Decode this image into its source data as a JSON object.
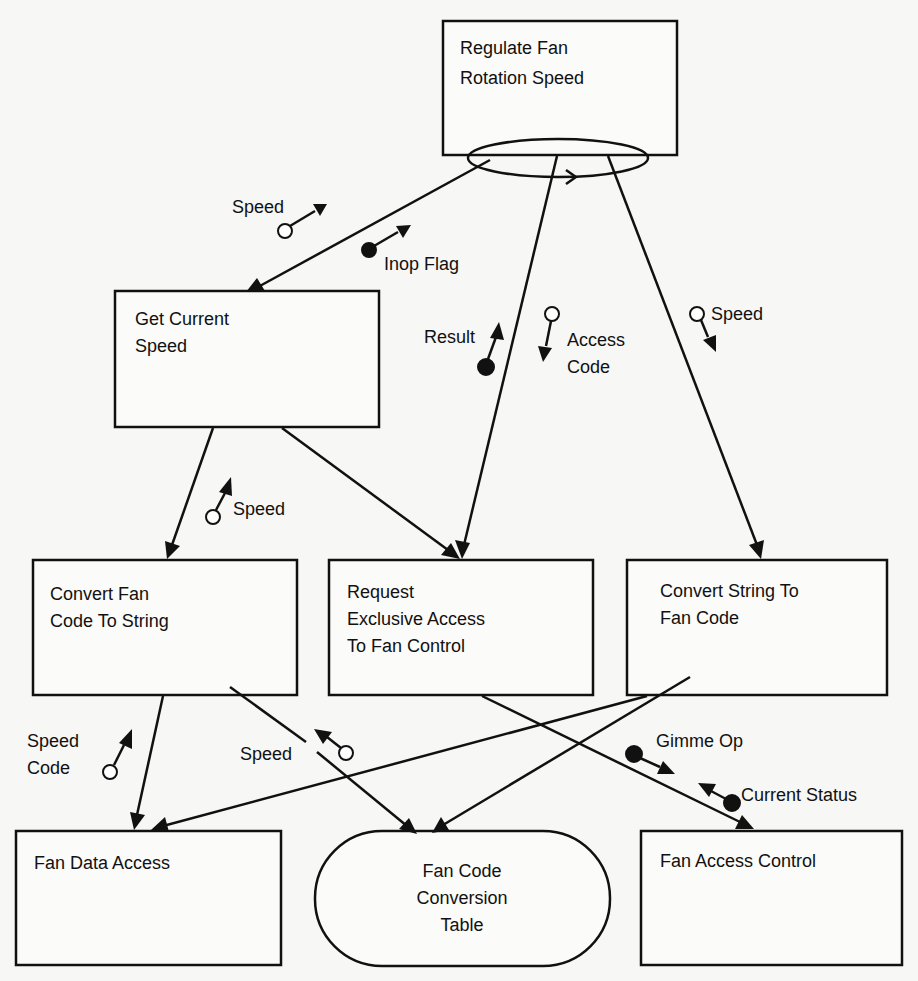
{
  "diagram": {
    "type": "structure-chart",
    "modules": {
      "regulate": {
        "line1": "Regulate Fan",
        "line2": "Rotation Speed"
      },
      "get_speed": {
        "line1": "Get Current",
        "line2": "Speed"
      },
      "code_to_string": {
        "line1": "Convert Fan",
        "line2": "Code To String"
      },
      "request_access": {
        "line1": "Request",
        "line2": "Exclusive Access",
        "line3": "To Fan Control"
      },
      "string_to_code": {
        "line1": "Convert String To",
        "line2": "Fan Code"
      },
      "fan_data_access": {
        "line1": "Fan Data Access"
      },
      "conversion_table": {
        "line1": "Fan Code",
        "line2": "Conversion",
        "line3": "Table"
      },
      "fan_access_control": {
        "line1": "Fan Access Control"
      }
    },
    "couples": {
      "speed_1": "Speed",
      "inop_flag": "Inop Flag",
      "result": "Result",
      "access_code_1": "Access",
      "access_code_2": "Code",
      "speed_2": "Speed",
      "speed_3": "Speed",
      "speed_code_1": "Speed",
      "speed_code_2": "Code",
      "speed_4": "Speed",
      "gimme_op": "Gimme Op",
      "current_status": "Current Status"
    },
    "connections": [
      {
        "from": "Regulate Fan Rotation Speed",
        "to": "Get Current Speed"
      },
      {
        "from": "Regulate Fan Rotation Speed",
        "to": "Request Exclusive Access To Fan Control"
      },
      {
        "from": "Regulate Fan Rotation Speed",
        "to": "Convert String To Fan Code"
      },
      {
        "from": "Get Current Speed",
        "to": "Convert Fan Code To String"
      },
      {
        "from": "Get Current Speed",
        "to": "Request Exclusive Access To Fan Control"
      },
      {
        "from": "Convert Fan Code To String",
        "to": "Fan Data Access"
      },
      {
        "from": "Convert Fan Code To String",
        "to": "Fan Code Conversion Table"
      },
      {
        "from": "Convert String To Fan Code",
        "to": "Fan Data Access"
      },
      {
        "from": "Convert String To Fan Code",
        "to": "Fan Code Conversion Table"
      },
      {
        "from": "Request Exclusive Access To Fan Control",
        "to": "Fan Access Control"
      }
    ]
  }
}
